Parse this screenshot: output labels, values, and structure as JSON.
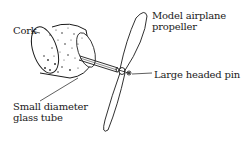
{
  "diagram": {
    "labels": {
      "cork": "Cork",
      "propeller_line1": "Model airplane",
      "propeller_line2": "propeller",
      "pin": "Large headed pin",
      "tube_line1": "Small diameter",
      "tube_line2": "glass tube"
    },
    "colors": {
      "ink": "#1a1a1a",
      "background": "#ffffff"
    }
  }
}
